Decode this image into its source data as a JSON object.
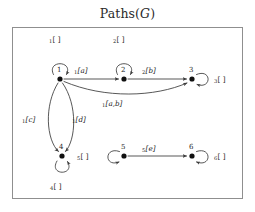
{
  "title": {
    "prefix": "Paths(",
    "italic": "G",
    "suffix": ")"
  },
  "diagram": {
    "type": "directed-graph",
    "nodes": [
      {
        "id": "1",
        "label": "1",
        "x": 60,
        "y": 79,
        "label_dx": -1,
        "label_dy": -11
      },
      {
        "id": "2",
        "label": "2",
        "x": 124,
        "y": 79,
        "label_dx": -1,
        "label_dy": -11
      },
      {
        "id": "3",
        "label": "3",
        "x": 192,
        "y": 79,
        "label_dx": -1,
        "label_dy": -11
      },
      {
        "id": "4",
        "label": "4",
        "x": 62,
        "y": 156,
        "label_dx": -1,
        "label_dy": -11
      },
      {
        "id": "5",
        "label": "5",
        "x": 124,
        "y": 156,
        "label_dx": -1,
        "label_dy": -11
      },
      {
        "id": "6",
        "label": "6",
        "x": 192,
        "y": 156,
        "label_dx": -1,
        "label_dy": -11
      }
    ],
    "edges": [
      {
        "from": "1",
        "to": "1",
        "kind": "self-loop",
        "side": "top",
        "sub": "1",
        "bracket": "[ ]",
        "label_x": 53,
        "label_y": 40
      },
      {
        "from": "2",
        "to": "2",
        "kind": "self-loop",
        "side": "top",
        "sub": "2",
        "bracket": "[ ]",
        "label_x": 117,
        "label_y": 40
      },
      {
        "from": "3",
        "to": "3",
        "kind": "self-loop",
        "side": "right",
        "sub": "3",
        "bracket": "[ ]",
        "label_x": 219,
        "label_y": 79
      },
      {
        "from": "4",
        "to": "4",
        "kind": "self-loop",
        "side": "bottom",
        "sub": "4",
        "bracket": "[ ]",
        "label_x": 54,
        "label_y": 188
      },
      {
        "from": "5",
        "to": "5",
        "kind": "self-loop",
        "side": "left",
        "sub": "5",
        "bracket": "[ ]",
        "label_x": 81,
        "label_y": 156
      },
      {
        "from": "6",
        "to": "6",
        "kind": "self-loop",
        "side": "right",
        "sub": "6",
        "bracket": "[ ]",
        "label_x": 219,
        "label_y": 156
      },
      {
        "from": "1",
        "to": "2",
        "kind": "straight",
        "sub": "1",
        "bracket": "[a]",
        "label_x": 82,
        "label_y": 71
      },
      {
        "from": "2",
        "to": "3",
        "kind": "straight",
        "sub": "2",
        "bracket": "[b]",
        "label_x": 150,
        "label_y": 71
      },
      {
        "from": "1",
        "to": "3",
        "kind": "curve",
        "sub": "1",
        "bracket": "[a,b]",
        "label_x": 112,
        "label_y": 104
      },
      {
        "from": "1",
        "to": "4",
        "kind": "curve-left",
        "sub": "1",
        "bracket": "[c]",
        "label_x": 28,
        "label_y": 119
      },
      {
        "from": "1",
        "to": "4",
        "kind": "curve-right",
        "sub": "1",
        "bracket": "[d]",
        "label_x": 78,
        "label_y": 119
      },
      {
        "from": "5",
        "to": "6",
        "kind": "straight",
        "sub": "5",
        "bracket": "[e]",
        "label_x": 150,
        "label_y": 148
      }
    ],
    "colors": {
      "stroke": "#3a3a3a",
      "node": "#111111",
      "frame": "#8f8f8f",
      "text": "#262626"
    }
  }
}
